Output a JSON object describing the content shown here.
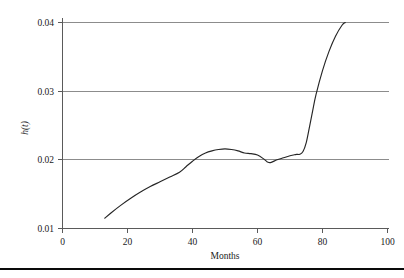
{
  "chart_data": {
    "type": "line",
    "title": "",
    "xlabel": "Months",
    "ylabel": "h(t)",
    "xlim": [
      0,
      100
    ],
    "ylim": [
      0.01,
      0.04
    ],
    "grid": true,
    "legend": null,
    "xticks": [
      "0",
      "20",
      "40",
      "60",
      "80",
      "100"
    ],
    "xtick_values": [
      0,
      20,
      40,
      60,
      80,
      100
    ],
    "yticks": [
      "0.01",
      "0.02",
      "0.03",
      "0.04"
    ],
    "ytick_values": [
      0.01,
      0.02,
      0.03,
      0.04
    ],
    "series": [
      {
        "name": "h(t)",
        "color": "#262626",
        "x": [
          13,
          15,
          18,
          21,
          24,
          27,
          30,
          33,
          36,
          38,
          40,
          42,
          44,
          46,
          48,
          50,
          52,
          54,
          56,
          58,
          60,
          62,
          63,
          64,
          66,
          68,
          70,
          71,
          72,
          73,
          74,
          75,
          76,
          77,
          78,
          80,
          82,
          84,
          86,
          87
        ],
        "y": [
          0.0115,
          0.0123,
          0.0134,
          0.0144,
          0.0153,
          0.0161,
          0.0168,
          0.0175,
          0.0182,
          0.019,
          0.0198,
          0.0205,
          0.021,
          0.0213,
          0.0215,
          0.0216,
          0.0215,
          0.0213,
          0.021,
          0.0209,
          0.0207,
          0.0201,
          0.0197,
          0.0196,
          0.02,
          0.0203,
          0.0206,
          0.0207,
          0.0208,
          0.0208,
          0.0212,
          0.0225,
          0.0248,
          0.0272,
          0.0295,
          0.033,
          0.0358,
          0.038,
          0.0396,
          0.04
        ]
      }
    ]
  },
  "axes": {
    "x_axis_label": "Months",
    "y_axis_label": "h(t)"
  }
}
